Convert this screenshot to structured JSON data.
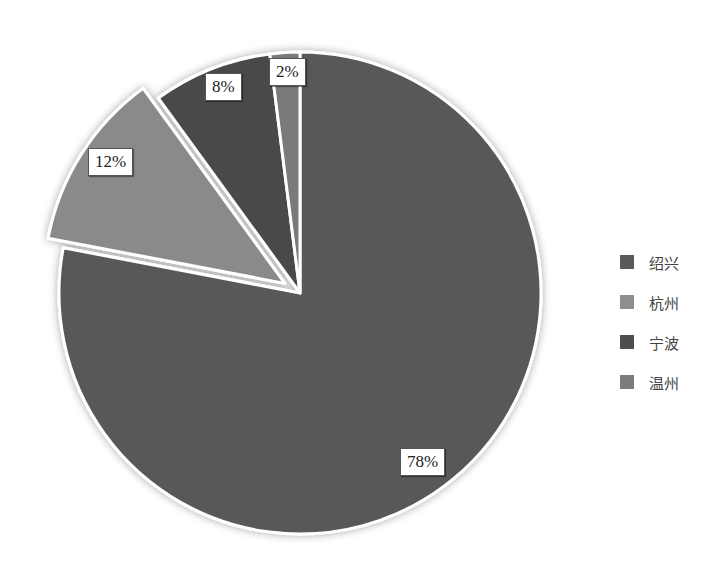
{
  "chart_data": {
    "type": "pie",
    "title": "",
    "categories": [
      "绍兴",
      "杭州",
      "宁波",
      "温州"
    ],
    "values": [
      78,
      12,
      8,
      2
    ],
    "labels": [
      "78%",
      "12%",
      "8%",
      "2%"
    ],
    "colors": [
      "#595959",
      "#8a8a8a",
      "#4a4a4a",
      "#7a7a7a"
    ],
    "exploded": [
      false,
      true,
      false,
      false
    ],
    "start_angle": "12 o'clock, clockwise",
    "legend_position": "right"
  },
  "legend": {
    "items": [
      {
        "label": "绍兴",
        "color": "#5a5a5a"
      },
      {
        "label": "杭州",
        "color": "#8e8e8e"
      },
      {
        "label": "宁波",
        "color": "#4e4e4e"
      },
      {
        "label": "温州",
        "color": "#7c7c7c"
      }
    ]
  },
  "data_labels": {
    "shaoxing": "78%",
    "hangzhou": "12%",
    "ningbo": "8%",
    "wenzhou": "2%"
  }
}
